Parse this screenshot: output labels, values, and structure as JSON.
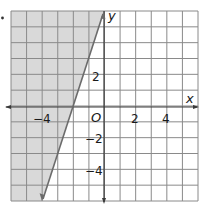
{
  "chart_data": {
    "type": "inequality-graph",
    "title": "",
    "xlabel": "x",
    "ylabel": "y",
    "origin_label": "O",
    "xlim": [
      -6,
      6
    ],
    "ylim": [
      -6,
      6
    ],
    "grid": true,
    "grid_step": 1,
    "x_tick_labels": [
      {
        "value": -4,
        "text": "−4"
      },
      {
        "value": 2,
        "text": "2"
      },
      {
        "value": 4,
        "text": "4"
      }
    ],
    "y_tick_labels": [
      {
        "value": 2,
        "text": "2"
      },
      {
        "value": -2,
        "text": "−2"
      },
      {
        "value": -4,
        "text": "−4"
      }
    ],
    "boundary_line": {
      "equation": "y = 3x + 6",
      "slope": 3,
      "intercept": 6,
      "style": "solid",
      "points": [
        [
          -4,
          -6
        ],
        [
          0,
          6
        ]
      ],
      "arrows": "both"
    },
    "inequality": "y ≥ 3x + 6",
    "shaded_region": "left of line (above)",
    "colors": {
      "shade": "#d9d9d9",
      "grid": "#8a8a8a",
      "axis": "#3a3a3a",
      "boundary": "#6b6b6b"
    }
  },
  "labels": {
    "x_axis": "x",
    "y_axis": "y",
    "origin": "O",
    "x_neg4": "−4",
    "x_2": "2",
    "x_4": "4",
    "y_2": "2",
    "y_neg2": "−2",
    "y_neg4": "−4"
  }
}
